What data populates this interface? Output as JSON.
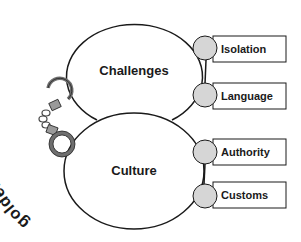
{
  "diagram": {
    "curved_label": "golden handcuffs",
    "top_ellipse": {
      "label": "Challenges"
    },
    "bottom_ellipse": {
      "label": "Culture"
    },
    "nodes": [
      {
        "label": "Isolation",
        "group": "Challenges"
      },
      {
        "label": "Language",
        "group": "Challenges"
      },
      {
        "label": "Authority",
        "group": "Culture"
      },
      {
        "label": "Customs",
        "group": "Culture"
      }
    ],
    "icon": "handcuffs-icon",
    "colors": {
      "stroke": "#1a1a1a",
      "node_fill": "#d6d6d6",
      "box_fill": "#ffffff",
      "handcuff_gray": "#8a8a8a"
    }
  }
}
